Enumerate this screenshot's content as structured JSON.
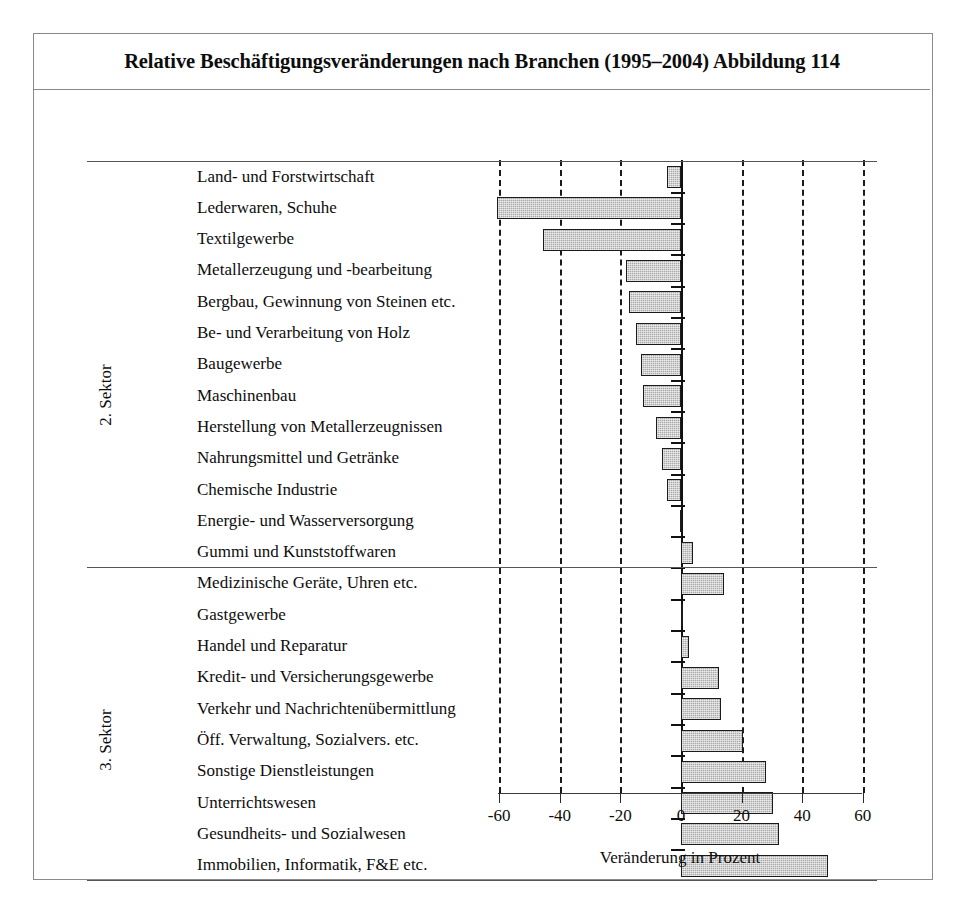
{
  "figure": {
    "title": "Relative Beschäftigungsveränderungen nach Branchen (1995–2004) Abbildung 114"
  },
  "sectors": [
    {
      "name": "2. Sektor"
    },
    {
      "name": "3. Sektor"
    }
  ],
  "axis": {
    "ticks": [
      "-60",
      "-40",
      "-20",
      "0",
      "20",
      "40",
      "60"
    ],
    "title": "Veränderung in Prozent"
  },
  "chart_data": {
    "type": "bar",
    "orientation": "horizontal",
    "title": "Relative Beschäftigungsveränderungen nach Branchen (1995–2004) Abbildung 114",
    "xlabel": "Veränderung in Prozent",
    "ylabel": "",
    "xlim": [
      -60,
      60
    ],
    "xticks": [
      -60,
      -40,
      -20,
      0,
      20,
      40,
      60
    ],
    "grid": true,
    "legend": null,
    "categories": [
      "Land- und Forstwirtschaft",
      "Lederwaren, Schuhe",
      "Textilgewerbe",
      "Metallerzeugung und -bearbeitung",
      "Bergbau, Gewinnung von Steinen etc.",
      "Be- und Verarbeitung von Holz",
      "Baugewerbe",
      "Maschinenbau",
      "Herstellung von Metallerzeugnissen",
      "Nahrungsmittel und Getränke",
      "Chemische Industrie",
      "Energie- und Wasserversorgung",
      "Gummi und Kunststoffwaren",
      "Medizinische Geräte, Uhren etc.",
      "Gastgewerbe",
      "Handel und Reparatur",
      "Kredit- und Versicherungsgewerbe",
      "Verkehr und Nachrichtenübermittlung",
      "Öff. Verwaltung, Sozialvers. etc.",
      "Sonstige Dienstleistungen",
      "Unterrichtswesen",
      "Gesundheits- und Sozialwesen",
      "Immobilien, Informatik, F&E etc."
    ],
    "values": [
      -4.7,
      -60.8,
      -45.7,
      -18.3,
      -17.2,
      -14.7,
      -13.3,
      -12.4,
      -8.4,
      -6.2,
      -4.5,
      -0.4,
      4.1,
      14.2,
      0.6,
      2.8,
      12.6,
      13.2,
      20.4,
      28.1,
      30.3,
      32.4,
      48.4
    ],
    "sector_groups": [
      {
        "label": "1. Sektor",
        "start": 0,
        "end": 0
      },
      {
        "label": "2. Sektor",
        "start": 1,
        "end": 13
      },
      {
        "label": "3. Sektor",
        "start": 14,
        "end": 22
      }
    ],
    "bar_color": "#a9a9a9",
    "bar_edge_color": "#1b1b1b"
  }
}
